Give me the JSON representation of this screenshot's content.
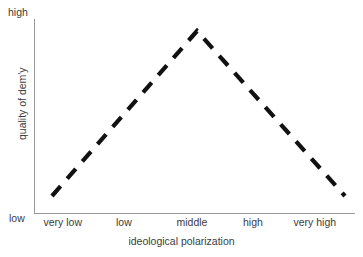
{
  "chart_data": {
    "type": "line",
    "title": "",
    "xlabel": "ideological polarization",
    "ylabel": "quality of dem'y",
    "grid": false,
    "legend": "none",
    "line_style": "dashed",
    "line_color": "#111111",
    "categories": [
      "very low",
      "low",
      "middle",
      "high",
      "very high"
    ],
    "x": [
      0,
      1,
      2,
      3,
      4
    ],
    "y": [
      0.05,
      0.5,
      1.0,
      0.5,
      0.05
    ],
    "series": [
      {
        "name": "quality of dem'y",
        "values": [
          0.05,
          0.5,
          1.0,
          0.5,
          0.05
        ]
      }
    ],
    "points_px": [
      {
        "x": 52,
        "y": 196
      },
      {
        "x": 197,
        "y": 31
      },
      {
        "x": 345,
        "y": 196
      }
    ],
    "ylim_labels": [
      "low",
      "high"
    ],
    "ytick_labels": [
      "low",
      "high"
    ],
    "xtick_labels": [
      "very low",
      "low",
      "middle",
      "high",
      "very high"
    ],
    "annotation": "inverted-V: quality of democracy peaks at middle ideological polarization"
  },
  "axes": {
    "y_top_label": "high",
    "y_bottom_label": "low",
    "y_axis_title": "quality of dem'y",
    "x_axis_title": "ideological polarization",
    "x_ticks": [
      {
        "label": "very low",
        "center_px": 63
      },
      {
        "label": "low",
        "center_px": 124
      },
      {
        "label": "middle",
        "center_px": 192
      },
      {
        "label": "high",
        "center_px": 253
      },
      {
        "label": "very high",
        "center_px": 315
      }
    ]
  },
  "colors": {
    "background": "#ffffff",
    "axis": "#9a9a9a",
    "text": "#3c3c3c",
    "data_line": "#111111"
  }
}
